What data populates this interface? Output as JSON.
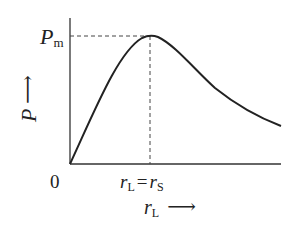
{
  "diagram": {
    "y_axis": {
      "symbol": "P",
      "arrow": "⟶"
    },
    "x_axis": {
      "symbol": "r",
      "subscript": "L",
      "arrow": "⟶"
    },
    "origin_label": "0",
    "peak_label": {
      "symbol": "P",
      "subscript": "m"
    },
    "peak_condition": {
      "left_symbol": "r",
      "left_sub": "L",
      "equals": "=",
      "right_symbol": "r",
      "right_sub": "S"
    },
    "curve_description": "rises from origin to maximum P_m at r_L = r_S, then decays"
  },
  "colors": {
    "line": "#222222",
    "dash": "#444444",
    "background": "#ffffff"
  }
}
